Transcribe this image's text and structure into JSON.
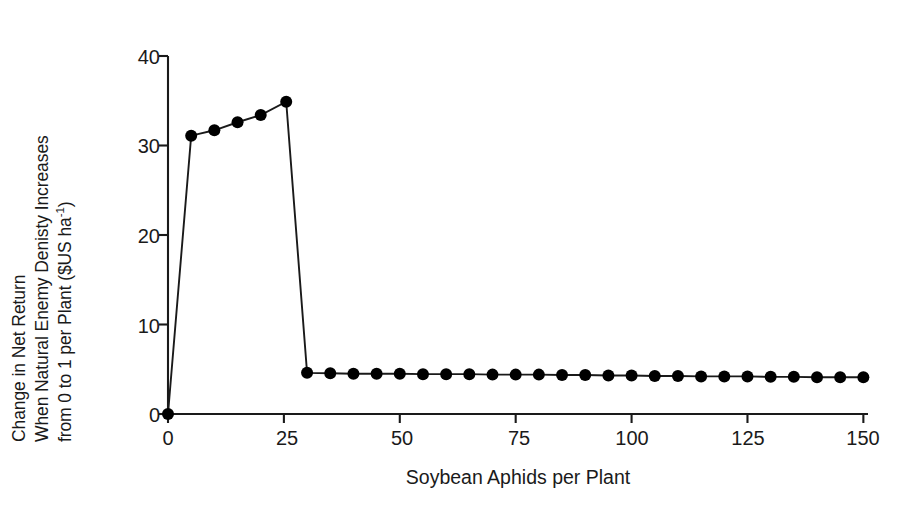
{
  "figure": {
    "background": "#ffffff",
    "ink_color": "#1a1a1a"
  },
  "axis": {
    "y_label_lines": [
      "Change in Net Return",
      "When Natural Enemy Denisty Increases",
      "from 0 to 1 per Plant ($US ha"
    ],
    "y_label_exponent": "-1",
    "y_label_tail": ")",
    "x_label": "Soybean Aphids per Plant",
    "y_ticks": [
      "0",
      "10",
      "20",
      "30",
      "40"
    ],
    "x_ticks": [
      "0",
      "25",
      "50",
      "75",
      "100",
      "125",
      "150"
    ]
  },
  "chart_data": {
    "type": "line",
    "title": "",
    "subtitle": "",
    "xlabel": "Soybean Aphids per Plant",
    "ylabel": "Change in Net Return When Natural Enemy Denisty Increases from 0 to 1 per Plant ($US ha-1)",
    "xlim": [
      0,
      151
    ],
    "ylim": [
      0,
      40
    ],
    "xticks": [
      0,
      25,
      50,
      75,
      100,
      125,
      150
    ],
    "yticks": [
      0,
      10,
      20,
      30,
      40
    ],
    "grid": false,
    "legend": null,
    "marker": "filled-circle",
    "marker_color": "#000000",
    "line_color": "#1a1a1a",
    "series": [
      {
        "name": "Change in net return",
        "x": [
          0,
          5,
          10,
          15,
          20,
          25.5,
          30,
          35,
          40,
          45,
          50,
          55,
          60,
          65,
          70,
          75,
          80,
          85,
          90,
          95,
          100,
          105,
          110,
          115,
          120,
          125,
          130,
          135,
          140,
          145,
          150
        ],
        "values": [
          0,
          31.1,
          31.7,
          32.6,
          33.4,
          34.9,
          4.6,
          4.55,
          4.5,
          4.5,
          4.5,
          4.45,
          4.45,
          4.45,
          4.4,
          4.4,
          4.4,
          4.35,
          4.35,
          4.3,
          4.3,
          4.25,
          4.25,
          4.2,
          4.2,
          4.2,
          4.15,
          4.15,
          4.1,
          4.1,
          4.1
        ]
      }
    ],
    "annotations": [
      "Sharp rise from 0 at 0 aphids per plant to a peak of about 34.9 near 25 aphids per plant",
      "Abrupt drop to about 4.6 at 30 aphids per plant",
      "Nearly flat, slightly declining plateau from about 4.6 down to 4.1 between 30 and 150 aphids per plant"
    ]
  }
}
